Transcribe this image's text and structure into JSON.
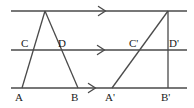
{
  "figure": {
    "name": "parallel-lines-triangle-shear-figure",
    "background_color": "#ffffff",
    "stroke_color": "#4a4a4a",
    "label_color": "#1a1a1a",
    "width": 194,
    "height": 108,
    "parallel_lines": [
      {
        "id": "top-parallel-line",
        "y": 11,
        "x1": 11,
        "x2": 187,
        "arrow_x": 103
      },
      {
        "id": "middle-parallel-line",
        "y": 50,
        "x1": 11,
        "x2": 187,
        "arrow_x": 102
      },
      {
        "id": "bottom-parallel-line",
        "y": 88,
        "x1": 11,
        "x2": 187,
        "arrow_x": 93
      }
    ],
    "triangle_left": {
      "id": "left-triangle",
      "apex": {
        "x": 45,
        "y": 11
      },
      "base_left": {
        "x": 22,
        "y": 88
      },
      "base_right": {
        "x": 78,
        "y": 88
      }
    },
    "triangle_right": {
      "id": "right-triangle",
      "apex": {
        "x": 168,
        "y": 11
      },
      "base_left": {
        "x": 112,
        "y": 88
      },
      "base_right": {
        "x": 168,
        "y": 88
      }
    },
    "labels": [
      {
        "id": "label-C",
        "text": "C",
        "x": 21,
        "y": 38
      },
      {
        "id": "label-D",
        "text": "D",
        "x": 58,
        "y": 38
      },
      {
        "id": "label-Cp",
        "text": "C'",
        "x": 129,
        "y": 38
      },
      {
        "id": "label-Dp",
        "text": "D'",
        "x": 169,
        "y": 38
      },
      {
        "id": "label-A",
        "text": "A",
        "x": 15,
        "y": 92
      },
      {
        "id": "label-B",
        "text": "B",
        "x": 71,
        "y": 92
      },
      {
        "id": "label-Ap",
        "text": "A'",
        "x": 105,
        "y": 92
      },
      {
        "id": "label-Bp",
        "text": "B'",
        "x": 161,
        "y": 92
      }
    ]
  }
}
